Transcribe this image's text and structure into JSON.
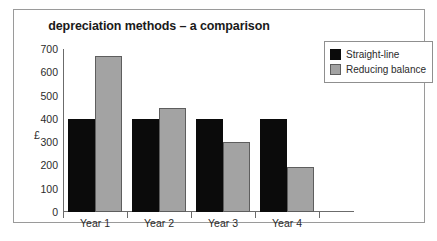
{
  "chart_data": {
    "type": "bar",
    "title": "depreciation methods – a comparison",
    "xlabel": "",
    "ylabel": "£",
    "categories": [
      "Year 1",
      "Year 2",
      "Year 3",
      "Year 4"
    ],
    "series": [
      {
        "name": "Straight-line",
        "color": "#0b0b0b",
        "values": [
          400,
          400,
          400,
          400
        ]
      },
      {
        "name": "Reducing balance",
        "color": "#a3a3a3",
        "values": [
          670,
          445,
          300,
          195
        ]
      }
    ],
    "ylim": [
      0,
      700
    ],
    "y_ticks": [
      0,
      100,
      200,
      300,
      400,
      500,
      600,
      700
    ],
    "y_tick_labels": [
      "0",
      "100",
      "200",
      "300",
      "400",
      "500",
      "600",
      "700"
    ],
    "grid": false,
    "legend_position": "top-right"
  }
}
